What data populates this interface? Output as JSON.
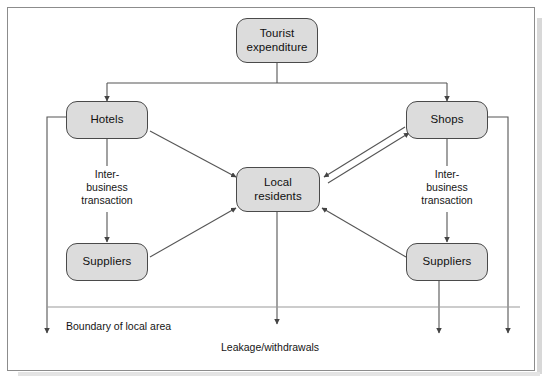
{
  "diagram": {
    "title_alt": "Tourism multiplier / local economy flow diagram",
    "nodes": {
      "tourist_expenditure": "Tourist\nexpenditure",
      "hotels": "Hotels",
      "shops": "Shops",
      "local_residents": "Local\nresidents",
      "suppliers_left": "Suppliers",
      "suppliers_right": "Suppliers"
    },
    "edge_labels": {
      "inter_business_left": "Inter-\nbusiness\ntransaction",
      "inter_business_right": "Inter-\nbusiness\ntransaction"
    },
    "annotations": {
      "boundary": "Boundary of local area",
      "leakage": "Leakage/withdrawals"
    },
    "colors": {
      "node_fill": "#dcdcdc",
      "node_stroke": "#4a4a4a",
      "line": "#555555",
      "frame": "#8c8c8c",
      "text": "#101010",
      "background": "#ffffff"
    }
  }
}
